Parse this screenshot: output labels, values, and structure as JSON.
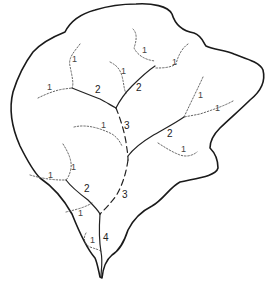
{
  "diagram": {
    "type": "drainage-basin-stream-order",
    "boundary": "basin-outline",
    "legend_orders": [
      "1",
      "2",
      "3",
      "4"
    ],
    "labels": [
      {
        "id": "l1a",
        "text": "1",
        "x": 72,
        "y": 62
      },
      {
        "id": "l1b",
        "text": "1",
        "x": 47,
        "y": 90
      },
      {
        "id": "l1c",
        "text": "1",
        "x": 121,
        "y": 74
      },
      {
        "id": "l1d",
        "text": "1",
        "x": 142,
        "y": 53
      },
      {
        "id": "l1e",
        "text": "1",
        "x": 172,
        "y": 65
      },
      {
        "id": "l1f",
        "text": "1",
        "x": 198,
        "y": 98
      },
      {
        "id": "l1g",
        "text": "1",
        "x": 215,
        "y": 111
      },
      {
        "id": "l1h",
        "text": "1",
        "x": 101,
        "y": 128
      },
      {
        "id": "l1i",
        "text": "1",
        "x": 181,
        "y": 152
      },
      {
        "id": "l1j",
        "text": "1",
        "x": 71,
        "y": 170
      },
      {
        "id": "l1k",
        "text": "1",
        "x": 48,
        "y": 178
      },
      {
        "id": "l1l",
        "text": "1",
        "x": 78,
        "y": 216
      },
      {
        "id": "l1m",
        "text": "1",
        "x": 90,
        "y": 243
      },
      {
        "id": "l2a",
        "text": "2",
        "x": 95,
        "y": 93
      },
      {
        "id": "l2b",
        "text": "2",
        "x": 136,
        "y": 91
      },
      {
        "id": "l2c",
        "text": "2",
        "x": 167,
        "y": 137
      },
      {
        "id": "l2d",
        "text": "2",
        "x": 84,
        "y": 192
      },
      {
        "id": "l3a",
        "text": "3",
        "x": 124,
        "y": 129
      },
      {
        "id": "l3b",
        "text": "3",
        "x": 122,
        "y": 198
      },
      {
        "id": "l4a",
        "text": "4",
        "x": 103,
        "y": 241
      }
    ]
  }
}
